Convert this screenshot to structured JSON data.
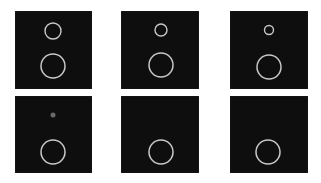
{
  "figure": {
    "layout": {
      "rows": 2,
      "cols": 3
    },
    "colors": {
      "background": "#ffffff",
      "panel": "#0e0e0e",
      "ring": "#c8c8c8",
      "dot": "#6a6a6a"
    },
    "panels": [
      {
        "x": 15,
        "y": 11,
        "w": 77,
        "h": 78,
        "small": {
          "cx": 38,
          "cy": 20,
          "r": 8,
          "type": "ring"
        },
        "large": {
          "cx": 38,
          "cy": 55,
          "r": 12
        }
      },
      {
        "x": 121,
        "y": 11,
        "w": 78,
        "h": 78,
        "small": {
          "cx": 40,
          "cy": 19,
          "r": 6,
          "type": "ring"
        },
        "large": {
          "cx": 40,
          "cy": 54,
          "r": 12
        }
      },
      {
        "x": 230,
        "y": 11,
        "w": 78,
        "h": 78,
        "small": {
          "cx": 39,
          "cy": 19,
          "r": 4.5,
          "type": "ring"
        },
        "large": {
          "cx": 39,
          "cy": 56,
          "r": 12
        }
      },
      {
        "x": 15,
        "y": 96,
        "w": 77,
        "h": 77,
        "small": {
          "cx": 38,
          "cy": 19,
          "r": 2.5,
          "type": "dot"
        },
        "large": {
          "cx": 38,
          "cy": 56,
          "r": 12
        }
      },
      {
        "x": 121,
        "y": 96,
        "w": 78,
        "h": 77,
        "small": null,
        "large": {
          "cx": 40,
          "cy": 56,
          "r": 12
        }
      },
      {
        "x": 230,
        "y": 96,
        "w": 78,
        "h": 77,
        "small": null,
        "large": {
          "cx": 38,
          "cy": 56,
          "r": 12
        }
      }
    ]
  }
}
